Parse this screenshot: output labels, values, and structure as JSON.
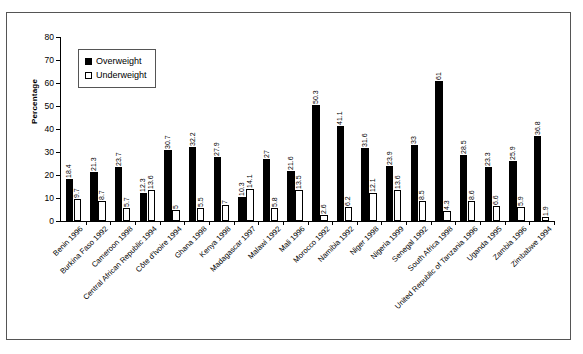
{
  "chart_data": {
    "type": "bar",
    "title": "",
    "xlabel": "",
    "ylabel": "Percentage",
    "ylim": [
      0,
      80
    ],
    "yticks": [
      0,
      10,
      20,
      30,
      40,
      50,
      60,
      70,
      80
    ],
    "grid": false,
    "legend_position": "top-left-inside",
    "categories": [
      "Benin 1996",
      "Burkina Faso 1992",
      "Cameroon 1998",
      "Central African Republic 1994",
      "Côte d'Ivoire 1994",
      "Ghana 1998",
      "Kenya 1998",
      "Madagascar 1997",
      "Malawi 1992",
      "Mali 1996",
      "Morocco 1992",
      "Namibia 1992",
      "Niger 1998",
      "Nigeria 1999",
      "Senegal 1992",
      "South Africa 1998",
      "United Republic of Tanzania 1996",
      "Uganda 1995",
      "Zambia 1996",
      "Zimbabwe 1994"
    ],
    "series": [
      {
        "name": "Overweight",
        "color": "#000000",
        "values": [
          18.4,
          21.3,
          23.7,
          12.3,
          30.7,
          32.2,
          27.9,
          10.3,
          27,
          21.6,
          50.3,
          41.1,
          31.6,
          23.9,
          33,
          61,
          28.5,
          23.3,
          25.9,
          36.8
        ]
      },
      {
        "name": "Underweight",
        "color": "#ffffff",
        "values": [
          9.7,
          8.7,
          5.7,
          13.6,
          5,
          5.5,
          7,
          14.1,
          5.8,
          13.5,
          2.6,
          6.2,
          12.1,
          13.6,
          8.5,
          4.3,
          8.6,
          6.6,
          5.9,
          1.9
        ]
      }
    ]
  },
  "legend": {
    "items": [
      {
        "label": "Overweight",
        "swatch": "filled-square-icon"
      },
      {
        "label": "Underweight",
        "swatch": "hollow-square-icon"
      }
    ]
  }
}
